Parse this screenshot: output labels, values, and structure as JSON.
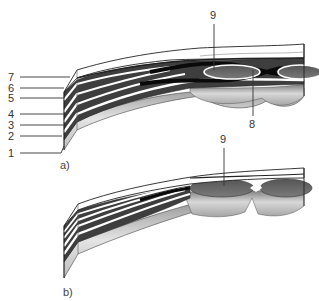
{
  "figure_a": {
    "caption": "a)",
    "labels": [
      {
        "id": "7",
        "text": "7"
      },
      {
        "id": "6",
        "text": "6"
      },
      {
        "id": "5",
        "text": "5"
      },
      {
        "id": "4",
        "text": "4"
      },
      {
        "id": "3",
        "text": "3"
      },
      {
        "id": "2",
        "text": "2"
      },
      {
        "id": "1",
        "text": "1"
      },
      {
        "id": "9",
        "text": "9"
      },
      {
        "id": "8",
        "text": "8"
      }
    ]
  },
  "figure_b": {
    "caption": "b)",
    "labels": [
      {
        "id": "9",
        "text": "9"
      }
    ]
  },
  "colors": {
    "dark_layer": "#4a4a4a",
    "black_layer": "#111111",
    "white_band": "#ffffff",
    "light_base": "#d4d4d4",
    "lens": "#6a6a6a",
    "outline": "#222222"
  }
}
